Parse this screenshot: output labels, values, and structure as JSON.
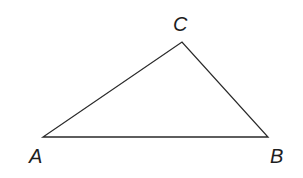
{
  "diagram": {
    "type": "triangle",
    "stroke_color": "#2a2a2a",
    "vertices": [
      {
        "name": "A",
        "x": 43,
        "y": 137,
        "label_x": 29,
        "label_y": 146
      },
      {
        "name": "B",
        "x": 268,
        "y": 137,
        "label_x": 270,
        "label_y": 146
      },
      {
        "name": "C",
        "x": 182,
        "y": 42,
        "label_x": 173,
        "label_y": 14
      }
    ],
    "labels": {
      "A": "A",
      "B": "B",
      "C": "C"
    }
  }
}
